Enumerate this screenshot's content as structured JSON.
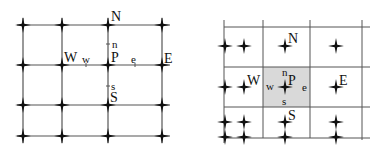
{
  "colors": {
    "line": "#555555",
    "node": "#111111",
    "shade": "#d9d9d9",
    "text": "#111111"
  },
  "left_diagram": {
    "title": "vertex-centered grid",
    "labels": {
      "N": "N",
      "S": "S",
      "W": "W",
      "E": "E",
      "P": "P",
      "n": "n",
      "s": "s",
      "w": "w",
      "e": "e"
    }
  },
  "right_diagram": {
    "title": "cell-centered grid",
    "labels": {
      "N": "N",
      "S": "S",
      "W": "W",
      "E": "E",
      "P": "P",
      "n": "n",
      "s": "s",
      "w": "w",
      "e": "e"
    }
  }
}
